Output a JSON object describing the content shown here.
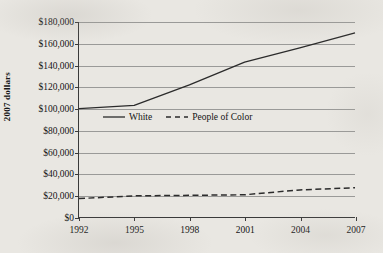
{
  "chart_data": {
    "type": "line",
    "title": "",
    "xlabel": "",
    "ylabel": "2007 dollars",
    "x": [
      1992,
      1995,
      1998,
      2001,
      2004,
      2007
    ],
    "xtick_labels": [
      "1992",
      "1995",
      "1998",
      "2001",
      "2004",
      "2007"
    ],
    "xlim": [
      1992,
      2007
    ],
    "ylim": [
      0,
      180000
    ],
    "ytick_values": [
      0,
      20000,
      40000,
      60000,
      80000,
      100000,
      120000,
      140000,
      160000,
      180000
    ],
    "ytick_labels": [
      "$0",
      "$20,000",
      "$40,000",
      "$60,000",
      "$80,000",
      "$100,000",
      "$120,000",
      "$140,000",
      "$160,000",
      "$180,000"
    ],
    "grid": "horizontal",
    "legend_position": "center",
    "series": [
      {
        "name": "White",
        "style": "solid",
        "color": "#2b2b2b",
        "values": [
          100000,
          103000,
          122000,
          143000,
          156000,
          170000
        ]
      },
      {
        "name": "People of Color",
        "style": "dashed",
        "color": "#2b2b2b",
        "values": [
          17000,
          19500,
          20000,
          20500,
          25000,
          27000
        ]
      }
    ]
  },
  "legend": {
    "items": [
      {
        "label": "White",
        "style": "solid"
      },
      {
        "label": "People of Color",
        "style": "dashed"
      }
    ]
  }
}
